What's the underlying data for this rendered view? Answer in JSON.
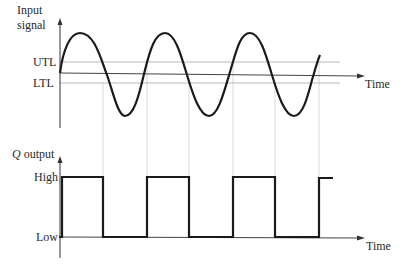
{
  "diagram": {
    "input_panel": {
      "y_axis_label_line1": "Input",
      "y_axis_label_line2": "signal",
      "upper_threshold_label": "UTL",
      "lower_threshold_label": "LTL",
      "x_axis_label": "Time"
    },
    "output_panel": {
      "y_axis_label_italic": "Q",
      "y_axis_label_rest": " output",
      "high_label": "High",
      "low_label": "Low",
      "x_axis_label": "Time"
    },
    "colors": {
      "signal": "#1a1a1a",
      "axis": "#2a2a2a",
      "threshold": "#b0b0b0",
      "guide": "#c8c8c8"
    }
  }
}
